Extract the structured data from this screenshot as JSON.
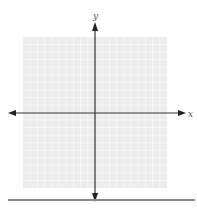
{
  "diagram": {
    "type": "coordinate-plane",
    "x_axis_label": "x",
    "y_axis_label": "y",
    "grid_cells_x": 20,
    "grid_cells_y": 20,
    "colors": {
      "grid_background": "#ececec",
      "grid_line": "#fafafa",
      "axis": "#333333",
      "divider": "#8a8a8a"
    }
  }
}
